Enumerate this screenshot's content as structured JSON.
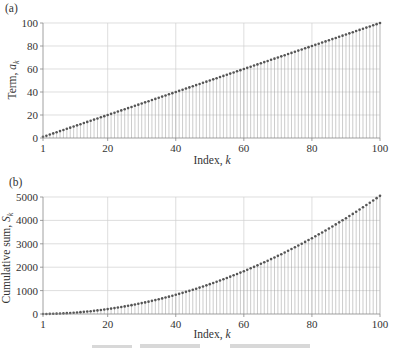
{
  "chart_data": [
    {
      "type": "scatter",
      "style": "stem",
      "panel_label": "(a)",
      "title": "",
      "xlabel": "Index, k",
      "ylabel": "Term, a_k",
      "ylabel_main": "Term, ",
      "ylabel_var": "a",
      "ylabel_sub": "k",
      "xlabel_main": "Index, ",
      "xlabel_var": "k",
      "xlim": [
        1,
        100
      ],
      "ylim": [
        0,
        100
      ],
      "xticks": [
        1,
        20,
        40,
        60,
        80,
        100
      ],
      "yticks": [
        0,
        20,
        40,
        60,
        80,
        100
      ],
      "grid": true,
      "formula": "a_k = k",
      "x": "1..100",
      "values_rule": "a_k = k for k = 1..100"
    },
    {
      "type": "scatter",
      "style": "stem",
      "panel_label": "(b)",
      "title": "",
      "xlabel": "Index, k",
      "ylabel": "Cumulative sum, S_k",
      "ylabel_main": "Cumulative sum, ",
      "ylabel_var": "S",
      "ylabel_sub": "k",
      "xlabel_main": "Index, ",
      "xlabel_var": "k",
      "xlim": [
        1,
        100
      ],
      "ylim": [
        0,
        5000
      ],
      "xticks": [
        1,
        20,
        40,
        60,
        80,
        100
      ],
      "yticks": [
        0,
        1000,
        2000,
        3000,
        4000,
        5000
      ],
      "grid": true,
      "formula": "S_k = k(k+1)/2",
      "values_rule": "S_k = sum_{i=1..k} i for k = 1..100 (S_100 = 5050)"
    }
  ]
}
